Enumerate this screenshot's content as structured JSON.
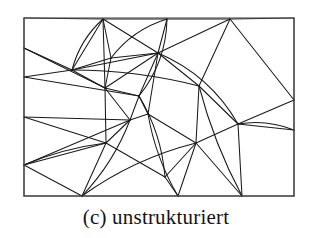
{
  "figure": {
    "caption": "(c) unstrukturiert",
    "label": "(c)",
    "title_text": "unstrukturiert",
    "background_color": "#ffffff",
    "line_color": "#1a1a1a",
    "frame_color": "#4d4d4d",
    "frame": {
      "x": 24,
      "y": 18,
      "width": 270,
      "height": 178
    },
    "mesh_type": "unstructured triangular mesh",
    "node_count": 27,
    "edge_count": 62
  },
  "chart_data": {
    "type": "diagram",
    "title": "(c) unstrukturiert",
    "xlabel": "",
    "ylabel": "",
    "grid": false,
    "legend": "none",
    "xlim": [
      24,
      294
    ],
    "ylim": [
      18,
      196
    ],
    "nodes": [
      {
        "id": "c-tl",
        "x": 24,
        "y": 18
      },
      {
        "id": "c-tr",
        "x": 294,
        "y": 18
      },
      {
        "id": "c-br",
        "x": 294,
        "y": 196
      },
      {
        "id": "c-bl",
        "x": 24,
        "y": 196
      },
      {
        "id": "t1",
        "x": 103,
        "y": 19
      },
      {
        "id": "t2",
        "x": 167,
        "y": 19
      },
      {
        "id": "t3",
        "x": 230,
        "y": 19
      },
      {
        "id": "l1",
        "x": 24,
        "y": 48
      },
      {
        "id": "l2",
        "x": 24,
        "y": 77
      },
      {
        "id": "l3",
        "x": 24,
        "y": 117
      },
      {
        "id": "l4",
        "x": 24,
        "y": 165
      },
      {
        "id": "r1",
        "x": 294,
        "y": 100
      },
      {
        "id": "r2",
        "x": 294,
        "y": 130
      },
      {
        "id": "b1",
        "x": 82,
        "y": 196
      },
      {
        "id": "b2",
        "x": 178,
        "y": 196
      },
      {
        "id": "b3",
        "x": 242,
        "y": 196
      },
      {
        "id": "n1",
        "x": 72,
        "y": 70
      },
      {
        "id": "n2",
        "x": 111,
        "y": 58
      },
      {
        "id": "n3",
        "x": 158,
        "y": 53
      },
      {
        "id": "n4",
        "x": 105,
        "y": 88
      },
      {
        "id": "n5",
        "x": 139,
        "y": 96
      },
      {
        "id": "n6",
        "x": 199,
        "y": 86
      },
      {
        "id": "n7",
        "x": 130,
        "y": 120
      },
      {
        "id": "n8",
        "x": 148,
        "y": 114
      },
      {
        "id": "n9",
        "x": 238,
        "y": 124
      },
      {
        "id": "n10",
        "x": 106,
        "y": 143
      },
      {
        "id": "n11",
        "x": 196,
        "y": 143
      },
      {
        "id": "n12",
        "x": 165,
        "y": 177
      }
    ],
    "straight_edges": [
      [
        "l1",
        "n1"
      ],
      [
        "l2",
        "n1"
      ],
      [
        "l1",
        "n4"
      ],
      [
        "l2",
        "n5"
      ],
      [
        "n1",
        "t1"
      ],
      [
        "n1",
        "n2"
      ],
      [
        "n1",
        "n4"
      ],
      [
        "n1",
        "n3"
      ],
      [
        "t1",
        "n2"
      ],
      [
        "t1",
        "n3"
      ],
      [
        "t1",
        "n4"
      ],
      [
        "t2",
        "n3"
      ],
      [
        "t3",
        "n3"
      ],
      [
        "t3",
        "n6"
      ],
      [
        "t3",
        "r1"
      ],
      [
        "n2",
        "n4"
      ],
      [
        "n2",
        "n3"
      ],
      [
        "n3",
        "n5"
      ],
      [
        "n3",
        "n6"
      ],
      [
        "n3",
        "n8"
      ],
      [
        "n3",
        "n4"
      ],
      [
        "n4",
        "n5"
      ],
      [
        "n4",
        "n7"
      ],
      [
        "n4",
        "n10"
      ],
      [
        "n5",
        "n7"
      ],
      [
        "n5",
        "n8"
      ],
      [
        "n6",
        "n9"
      ],
      [
        "n6",
        "n11"
      ],
      [
        "n7",
        "n8"
      ],
      [
        "n7",
        "n10"
      ],
      [
        "n8",
        "n11"
      ],
      [
        "n9",
        "r1"
      ],
      [
        "n9",
        "r2"
      ],
      [
        "n9",
        "n11"
      ],
      [
        "n9",
        "b3"
      ],
      [
        "l3",
        "n10"
      ],
      [
        "l3",
        "n7"
      ],
      [
        "l4",
        "n10"
      ],
      [
        "l4",
        "b1"
      ],
      [
        "l4",
        "n7"
      ],
      [
        "n10",
        "n12"
      ],
      [
        "n10",
        "b1"
      ],
      [
        "n11",
        "n12"
      ],
      [
        "n11",
        "b2"
      ],
      [
        "n11",
        "b3"
      ],
      [
        "n12",
        "b2"
      ],
      [
        "c-tl",
        "t1"
      ],
      [
        "t1",
        "t2"
      ],
      [
        "t2",
        "t3"
      ],
      [
        "t3",
        "c-tr"
      ],
      [
        "c-tl",
        "l1"
      ],
      [
        "l1",
        "l2"
      ],
      [
        "l2",
        "l3"
      ],
      [
        "l3",
        "l4"
      ],
      [
        "l4",
        "c-bl"
      ],
      [
        "c-tr",
        "r1"
      ],
      [
        "r1",
        "r2"
      ],
      [
        "r2",
        "c-br"
      ],
      [
        "c-bl",
        "b1"
      ],
      [
        "b1",
        "b2"
      ],
      [
        "b2",
        "b3"
      ],
      [
        "b3",
        "c-br"
      ]
    ],
    "curved_edges": [
      {
        "from": "t1",
        "to": "n1",
        "bow": 9
      },
      {
        "from": "n2",
        "to": "t2",
        "bow": -11
      },
      {
        "from": "t2",
        "to": "n5",
        "bow": -14
      },
      {
        "from": "n1",
        "to": "n6",
        "bow": -8
      },
      {
        "from": "n3",
        "to": "n9",
        "bow": -18
      },
      {
        "from": "n9",
        "to": "r2",
        "bow": -8
      },
      {
        "from": "n5",
        "to": "n12",
        "bow": -10
      },
      {
        "from": "n7",
        "to": "b1",
        "bow": -9
      },
      {
        "from": "b1",
        "to": "n11",
        "bow": -12
      },
      {
        "from": "n6",
        "to": "b3",
        "bow": 7
      },
      {
        "from": "l4",
        "to": "n10",
        "bow": -6
      },
      {
        "from": "n8",
        "to": "b2",
        "bow": 8
      }
    ]
  }
}
